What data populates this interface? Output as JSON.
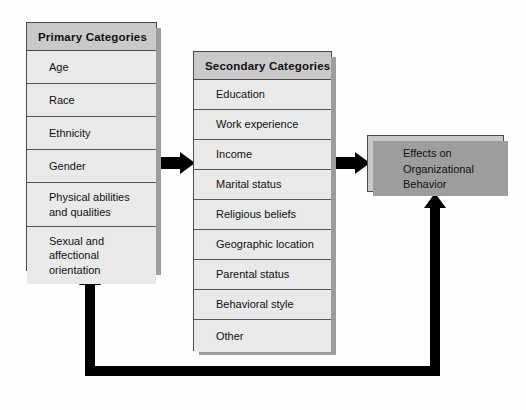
{
  "diagram": {
    "primary": {
      "header": "Primary Categories",
      "items": [
        "Age",
        "Race",
        "Ethnicity",
        "Gender",
        "Physical abilities\nand qualities",
        "Sexual and\naffectional\norientation"
      ]
    },
    "secondary": {
      "header": "Secondary Categories",
      "items": [
        "Education",
        "Work experience",
        "Income",
        "Marital status",
        "Religious beliefs",
        "Geographic location",
        "Parental status",
        "Behavioral style",
        "Other"
      ]
    },
    "effects": {
      "label": "Effects on\nOrganizational\nBehavior"
    },
    "connectors": [
      {
        "name": "primary-to-secondary",
        "direction": "right"
      },
      {
        "name": "secondary-to-effects",
        "direction": "right"
      },
      {
        "name": "effects-feedback-to-primary",
        "direction": "up"
      }
    ],
    "colors": {
      "header_fill": "#c9c9c9",
      "row_fill": "#e9e9e9",
      "effects_fill": "#c9c9c9",
      "border": "#4a4a4a",
      "shadow": "#9d9d9d",
      "arrow": "#000000",
      "background": "#fdfdfd"
    }
  }
}
